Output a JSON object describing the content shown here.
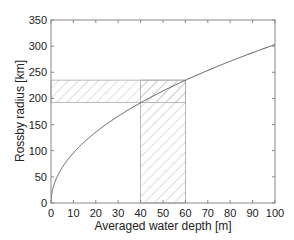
{
  "chart_data": {
    "type": "line",
    "title": "",
    "xlabel": "Averaged water depth [m]",
    "ylabel": "Rossby radius [km]",
    "xlim": [
      0,
      100
    ],
    "ylim": [
      0,
      350
    ],
    "xticks": [
      0,
      10,
      20,
      30,
      40,
      50,
      60,
      70,
      80,
      90,
      100
    ],
    "yticks": [
      0,
      50,
      100,
      150,
      200,
      250,
      300,
      350
    ],
    "grid": false,
    "legend": null,
    "series": [
      {
        "name": "Rossby radius vs depth",
        "x": [
          0,
          1,
          2,
          5,
          10,
          15,
          20,
          30,
          40,
          50,
          60,
          70,
          80,
          90,
          100
        ],
        "y": [
          0,
          30,
          43,
          68,
          96,
          117,
          135,
          166,
          192,
          214,
          235,
          253,
          271,
          287,
          303
        ],
        "color": "#555555"
      }
    ],
    "annotations": [
      {
        "type": "hatched-band-horizontal",
        "x_range": [
          0,
          60
        ],
        "y_range": [
          192,
          235
        ],
        "description": "Rossby radius range for depth 40-60 m"
      },
      {
        "type": "hatched-band-vertical",
        "x_range": [
          40,
          60
        ],
        "y_range": [
          0,
          235
        ],
        "description": "Water depth range 40-60 m"
      }
    ]
  },
  "colors": {
    "axis": "#888888",
    "curve": "#555555",
    "hatch": "#b8b8b8",
    "text": "#222222"
  }
}
